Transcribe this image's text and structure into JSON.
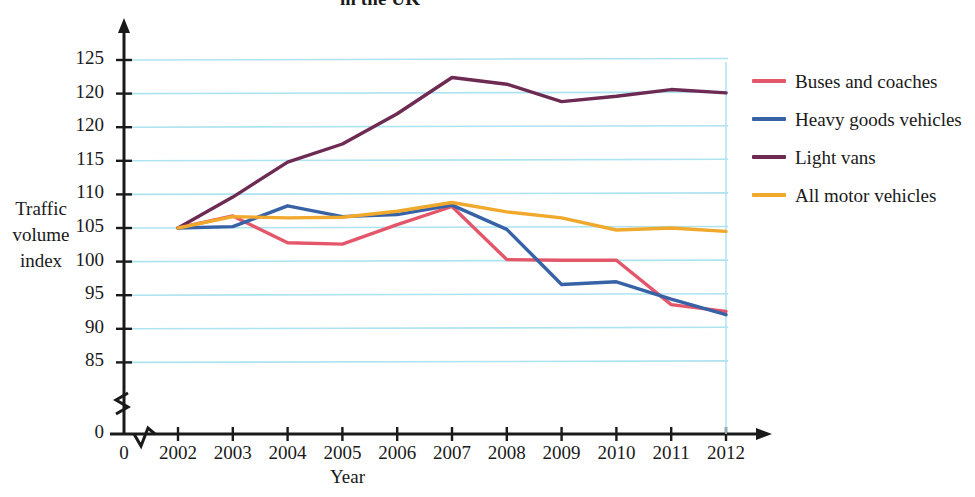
{
  "chart_data": {
    "type": "line",
    "title": "in the UK",
    "xlabel": "Year",
    "ylabel": "Traffic volume index",
    "ylabel_lines": [
      "Traffic",
      "volume",
      "index"
    ],
    "x": [
      2002,
      2003,
      2004,
      2005,
      2006,
      2007,
      2008,
      2009,
      2010,
      2011,
      2012
    ],
    "xtick_labels": [
      "0",
      "2002",
      "2003",
      "2004",
      "2005",
      "2006",
      "2007",
      "2008",
      "2009",
      "2010",
      "2011",
      "2012"
    ],
    "ytick_labels": [
      "125",
      "120",
      "120",
      "115",
      "110",
      "105",
      "100",
      "95",
      "90",
      "85",
      "0"
    ],
    "ytick_values": [
      125,
      120,
      115,
      110,
      105,
      100,
      95,
      90,
      85
    ],
    "ylim": [
      83,
      127
    ],
    "axis_break": true,
    "grid": true,
    "grid_color": "#aee3f0",
    "legend_position": "right",
    "series": [
      {
        "name": "Buses and coaches",
        "color": "#e4566a",
        "values": [
          100.0,
          101.8,
          97.8,
          97.6,
          100.5,
          103.2,
          95.3,
          95.2,
          95.2,
          88.6,
          87.6
        ]
      },
      {
        "name": "Heavy goods vehicles",
        "color": "#3862a6",
        "values": [
          100.0,
          100.2,
          103.3,
          101.7,
          102.0,
          103.4,
          99.8,
          91.6,
          92.0,
          89.4,
          87.1
        ]
      },
      {
        "name": "Light vans",
        "color": "#6d2a52",
        "values": [
          100.0,
          104.6,
          109.8,
          112.5,
          117.0,
          122.4,
          121.4,
          118.8,
          119.6,
          120.6,
          120.1
        ]
      },
      {
        "name": "All motor vehicles",
        "color": "#f0a92c",
        "values": [
          100.0,
          101.7,
          101.5,
          101.6,
          102.5,
          103.8,
          102.4,
          101.5,
          99.7,
          100.0,
          99.5
        ]
      }
    ]
  },
  "legend": {
    "entries": [
      {
        "label": "Buses and coaches",
        "color": "#e4566a"
      },
      {
        "label": "Heavy goods vehicles",
        "color": "#3862a6"
      },
      {
        "label": "Light vans",
        "color": "#6d2a52"
      },
      {
        "label": "All motor vehicles",
        "color": "#f0a92c"
      }
    ]
  },
  "axes": {
    "x_title": "Year",
    "y_title_lines": [
      "Traffic",
      "volume",
      "index"
    ]
  }
}
